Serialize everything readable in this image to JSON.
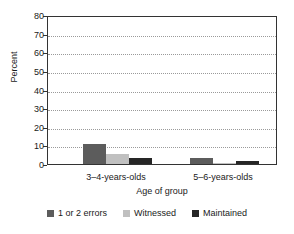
{
  "chart_data": {
    "type": "bar",
    "title": "",
    "xlabel": "Age of group",
    "ylabel": "Percent",
    "categories": [
      "3–4-years-olds",
      "5–6-years-olds"
    ],
    "series": [
      {
        "name": "1 or 2 errors",
        "values": [
          10.5,
          3.0
        ],
        "color": "#5c5c5c"
      },
      {
        "name": "Witnessed",
        "values": [
          5.5,
          0.6
        ],
        "color": "#c0c0c0"
      },
      {
        "name": "Maintained",
        "values": [
          3.0,
          1.5
        ],
        "color": "#262626"
      }
    ],
    "ylim": [
      0,
      80
    ],
    "yticks": [
      0,
      10,
      20,
      30,
      40,
      50,
      60,
      70,
      80
    ],
    "ytick_labels": [
      "0",
      "10",
      "20",
      "30",
      "40",
      "50",
      "60",
      "70",
      "80"
    ],
    "grid": true,
    "grid_style": "dotted-horizontal",
    "legend_position": "bottom",
    "axis_color": "#333333",
    "gridline_color": "#9a9a9a",
    "background": "#ffffff"
  },
  "axes": {
    "y_title": "Percent",
    "x_title": "Age of group"
  },
  "legend": {
    "entries": [
      {
        "label": "1 or 2 errors",
        "color": "#5c5c5c",
        "icon": "square-swatch-icon"
      },
      {
        "label": "Witnessed",
        "color": "#c0c0c0",
        "icon": "square-swatch-icon"
      },
      {
        "label": "Maintained",
        "color": "#262626",
        "icon": "square-swatch-icon"
      }
    ]
  }
}
